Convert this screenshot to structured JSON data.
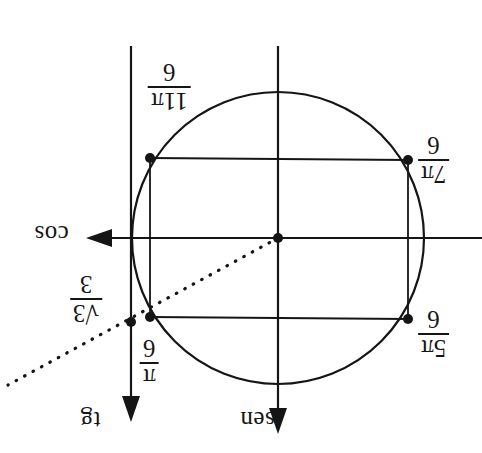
{
  "figure": {
    "kind": "unit-circle-trigonometric-diagram",
    "orientation_note": "entire figure rendered rotated 180 degrees",
    "axes": {
      "horizontal_label": "cos",
      "vertical_label": "sen",
      "tangent_label": "tg"
    },
    "angle_labels": [
      {
        "id": "pi-6",
        "numerator": "π",
        "denominator": "6"
      },
      {
        "id": "5pi-6",
        "numerator": "5π",
        "denominator": "6"
      },
      {
        "id": "7pi-6",
        "numerator": "7π",
        "denominator": "6"
      },
      {
        "id": "11pi-6",
        "numerator": "11π",
        "denominator": "6"
      }
    ],
    "tangent_value": {
      "numerator": "√3",
      "denominator": "3"
    },
    "colors": {
      "ink": "#151515",
      "background": "#ffffff"
    },
    "geometry": {
      "center": [
        278,
        238
      ],
      "radius": 146,
      "tangent_axis_x": 131,
      "points": {
        "top_left": [
          150,
          158
        ],
        "top_right": [
          408,
          160
        ],
        "bottom_left": [
          150,
          317
        ],
        "bottom_right": [
          408,
          319
        ],
        "tangent_point": [
          131,
          322
        ]
      }
    }
  }
}
